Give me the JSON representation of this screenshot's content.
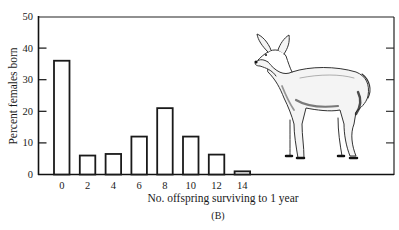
{
  "chart_data": {
    "type": "bar",
    "title": "",
    "panel_label": "(B)",
    "xlabel": "No. offspring surviving to 1 year",
    "ylabel": "Percent females born",
    "categories": [
      "0",
      "2",
      "4",
      "6",
      "8",
      "10",
      "12",
      "14"
    ],
    "values": [
      36,
      6,
      6.5,
      12,
      21,
      12,
      6.3,
      1
    ],
    "ylim": [
      0,
      50
    ],
    "yticks": [
      "0",
      "10",
      "20",
      "30",
      "40",
      "50"
    ],
    "grid": false,
    "legend": null,
    "bar_fill": "#ffffff",
    "bar_stroke": "#1a1a1a",
    "illustration": "deer-doe"
  }
}
